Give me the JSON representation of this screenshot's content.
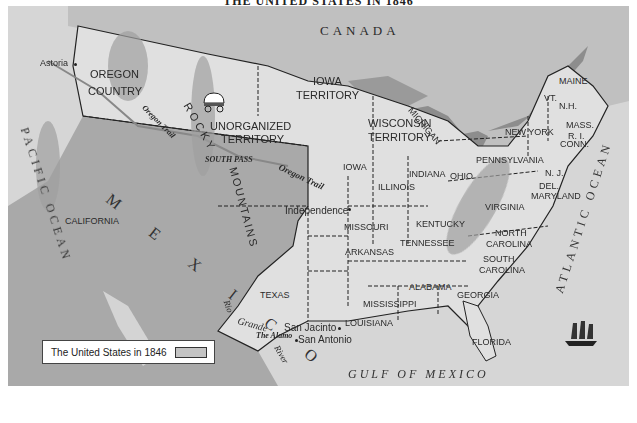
{
  "title": "THE UNITED STATES IN 1846",
  "colors": {
    "water": "#8a8a8a",
    "us_territory": "#dcdcdc",
    "foreign_land": "#a8a8a8",
    "mountains": "#9a9a9a",
    "border": "#222222"
  },
  "regions": {
    "canada": "CANADA",
    "mexico": "M E X I C O",
    "oregon_country_1": "OREGON",
    "oregon_country_2": "COUNTRY",
    "unorganized_1": "UNORGANIZED",
    "unorganized_2": "TERRITORY",
    "iowa_territory_1": "IOWA",
    "iowa_territory_2": "TERRITORY",
    "wisconsin_territory_1": "WISCONSIN",
    "wisconsin_territory_2": "TERRITORY",
    "california": "CALIFORNIA",
    "texas": "TEXAS"
  },
  "states": {
    "maine": "MAINE",
    "vt": "VT.",
    "nh": "N.H.",
    "mass": "MASS.",
    "ri": "R. I.",
    "conn": "CONN.",
    "new_york": "NEW YORK",
    "pennsylvania": "PENNSYLVANIA",
    "nj": "N. J.",
    "del": "DEL.",
    "maryland": "MARYLAND",
    "virginia": "VIRGINIA",
    "north_carolina_1": "NORTH",
    "north_carolina_2": "CAROLINA",
    "south_carolina_1": "SOUTH",
    "south_carolina_2": "CAROLINA",
    "georgia": "GEORGIA",
    "florida": "FLORIDA",
    "alabama": "ALABAMA",
    "mississippi": "MISSISSIPPI",
    "louisiana": "LOUISIANA",
    "tennessee": "TENNESSEE",
    "kentucky": "KENTUCKY",
    "ohio": "OHIO",
    "indiana": "INDIANA",
    "illinois": "ILLINOIS",
    "michigan": "MICHIGAN",
    "iowa": "IOWA",
    "missouri": "MISSOURI",
    "arkansas": "ARKANSAS"
  },
  "places": {
    "astoria": "Astoria",
    "independence": "Independence",
    "san_jacinto": "San Jacinto",
    "san_antonio": "San Antonio",
    "the_alamo": "The Alamo",
    "south_pass": "SOUTH PASS"
  },
  "features": {
    "rocky_1": "ROCKY",
    "rocky_2": "MOUNTAINS",
    "oregon_trail": "Oregon Trail",
    "oregon_trail_west": "Oregon Trail",
    "rio_grande_1": "Rio",
    "rio_grande_2": "Grande",
    "rio_grande_3": "River"
  },
  "water": {
    "pacific": "PACIFIC OCEAN",
    "atlantic": "ATLANTIC OCEAN",
    "gulf": "GULF OF MEXICO"
  },
  "legend": {
    "label": "The United States in 1846"
  },
  "icons": [
    "covered-wagon-icon",
    "sailing-ship-icon"
  ]
}
